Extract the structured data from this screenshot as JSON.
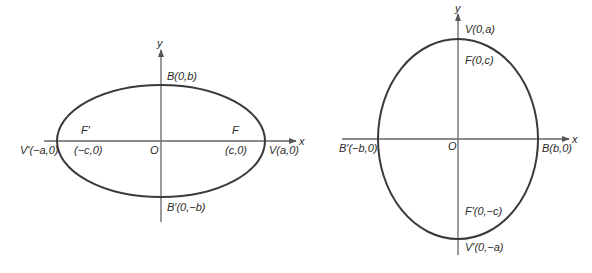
{
  "diagrams": [
    {
      "name": "horizontal-ellipse",
      "orientation": "major axis along x",
      "center": {
        "x": 161,
        "y": 141
      },
      "rx": 104,
      "ry": 56,
      "axes": {
        "x_label": "x",
        "y_label": "y"
      },
      "labels": {
        "origin": "O",
        "top_covertex": "B(0,b)",
        "bottom_covertex": "B′(0,−b)",
        "left_vertex": "V′(−a,0)",
        "right_vertex": "V(a,0)",
        "left_focus_name": "F′",
        "left_focus_coord": "(−c,0)",
        "right_focus_name": "F",
        "right_focus_coord": "(c,0)"
      }
    },
    {
      "name": "vertical-ellipse",
      "orientation": "major axis along y",
      "center": {
        "x": 458,
        "y": 139
      },
      "rx": 80,
      "ry": 100,
      "axes": {
        "x_label": "x",
        "y_label": "y"
      },
      "labels": {
        "origin": "O",
        "top_vertex": "V(0,a)",
        "top_focus": "F(0,c)",
        "bottom_focus": "F′(0,−c)",
        "bottom_vertex": "V′(0,−a)",
        "left_covertex": "B′(−b,0)",
        "right_covertex": "B(b,0)"
      }
    }
  ],
  "colors": {
    "curve": "#3a3a3a",
    "axis": "#666666",
    "text": "#2a2a2a",
    "background": "#ffffff"
  }
}
